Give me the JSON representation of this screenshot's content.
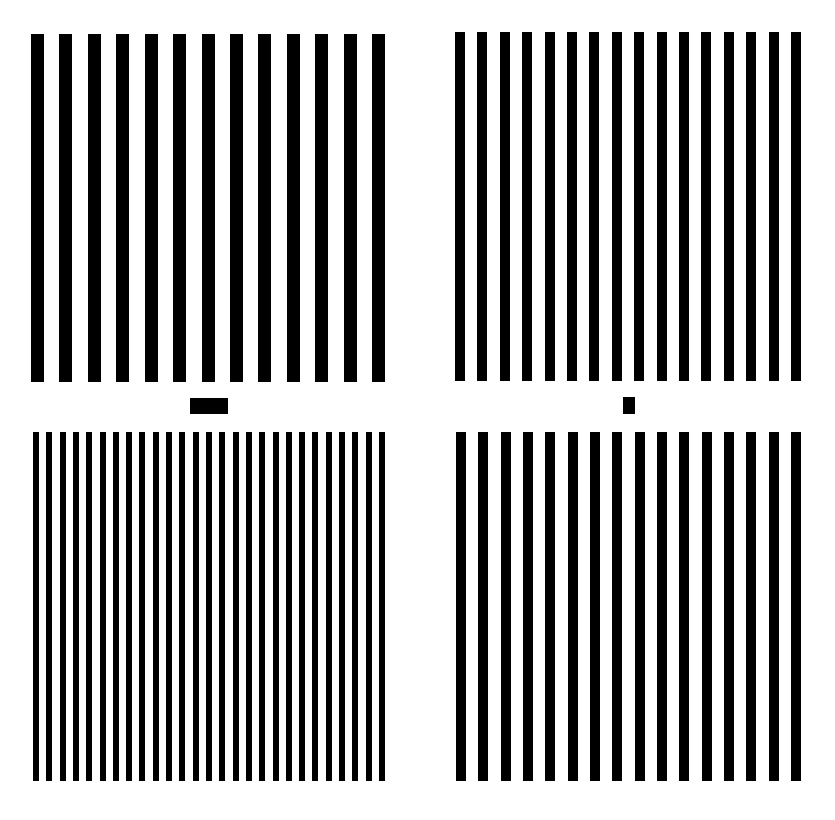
{
  "figure": {
    "background": "#ffffff",
    "ink": "#000000",
    "panels": [
      {
        "id": "top-left",
        "label": "low spatial frequency grating (adapting, top)",
        "x": 31,
        "y": 34,
        "width": 354,
        "height": 348,
        "bar_count": 13,
        "bar_width": 13
      },
      {
        "id": "top-right",
        "label": "medium spatial frequency grating (test, top)",
        "x": 455,
        "y": 32,
        "width": 346,
        "height": 349,
        "bar_count": 16,
        "bar_width": 10
      },
      {
        "id": "bottom-left",
        "label": "high spatial frequency grating (adapting, bottom)",
        "x": 33,
        "y": 432,
        "width": 352,
        "height": 349,
        "bar_count": 27,
        "bar_width": 6
      },
      {
        "id": "bottom-right",
        "label": "medium spatial frequency grating (test, bottom)",
        "x": 456,
        "y": 432,
        "width": 345,
        "height": 349,
        "bar_count": 16,
        "bar_width": 10
      }
    ],
    "markers": [
      {
        "id": "left-fixation-bar",
        "label": "fixation bar between left gratings",
        "x": 190,
        "y": 398,
        "width": 38,
        "height": 16
      },
      {
        "id": "right-fixation-dot",
        "label": "fixation mark between right gratings",
        "x": 623,
        "y": 397,
        "width": 12,
        "height": 17
      }
    ]
  }
}
